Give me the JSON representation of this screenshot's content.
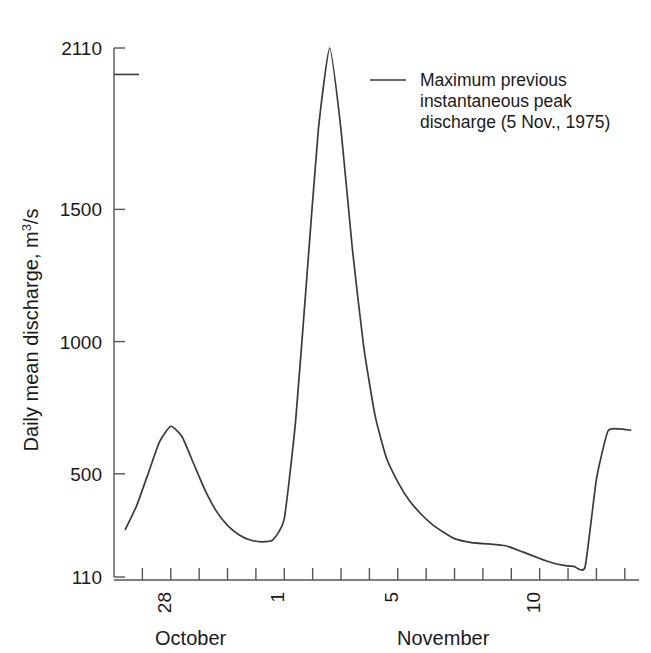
{
  "chart_data": {
    "type": "line",
    "title": "",
    "xlabel": "",
    "ylabel": "Daily mean discharge, m3/s",
    "ylabel_main": "Daily mean discharge, m",
    "ylabel_sup": "3",
    "ylabel_tail": "/s",
    "ylim": [
      110,
      2110
    ],
    "yticks": [
      110,
      500,
      1000,
      1500,
      2110
    ],
    "yticklabels": [
      "110",
      "500",
      "1000",
      "1500",
      "2110"
    ],
    "grid": false,
    "xlim": [
      26.0,
      44.5
    ],
    "xticks_day_labels": [
      "28",
      "1",
      "5",
      "10"
    ],
    "x_month_labels": [
      "October",
      "November"
    ],
    "legend_position": "top-right",
    "legend": [
      {
        "label_line1": "Maximum previous",
        "label_line2": "instantaneous peak",
        "label_line3": "discharge (5 Nov., 1975)",
        "value": 2010,
        "marker": "line",
        "color": "#3a3a3a"
      }
    ],
    "annotations": [
      {
        "name": "max-previous-instantaneous-peak-reference-line",
        "value": 2010,
        "description": "Horizontal reference tick at maximum previous instantaneous peak discharge"
      }
    ],
    "x": [
      26.4,
      26.8,
      27.2,
      27.6,
      28.0,
      28.4,
      28.8,
      29.2,
      29.6,
      30.0,
      30.4,
      30.8,
      31.2,
      31.6,
      32.0,
      32.4,
      32.8,
      33.2,
      33.6,
      34.0,
      34.4,
      34.8,
      35.2,
      35.6,
      36.0,
      36.4,
      36.8,
      37.2,
      37.6,
      38.0,
      38.6,
      39.2,
      39.8,
      40.4,
      41.0,
      41.4,
      41.8,
      42.2,
      42.6,
      43.0,
      43.4,
      43.8,
      44.2
    ],
    "values": [
      290,
      380,
      500,
      620,
      680,
      640,
      540,
      440,
      360,
      305,
      270,
      250,
      243,
      250,
      330,
      700,
      1250,
      1800,
      2110,
      1800,
      1350,
      980,
      720,
      560,
      470,
      400,
      350,
      310,
      280,
      255,
      240,
      235,
      228,
      205,
      180,
      165,
      155,
      150,
      148,
      480,
      660,
      670,
      665
    ],
    "series": [
      {
        "name": "Daily mean discharge",
        "color": "#3a3a3a",
        "peak_value": 2110,
        "peak_day_label": "1",
        "peak_month": "November",
        "secondary_peak_value": 680,
        "secondary_peak_day_label": "28",
        "minimum_value": 148,
        "minimum_day_label": "10"
      }
    ],
    "units": "m3/s"
  },
  "figure": {
    "background": "#ffffff",
    "line_color": "#3a3a3a",
    "axis_color": "#555555",
    "text_color": "#1a1a1a"
  }
}
